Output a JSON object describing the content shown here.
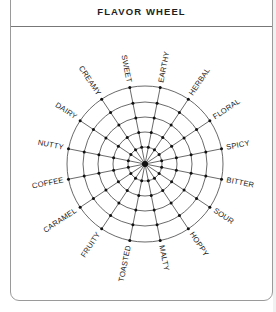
{
  "card": {
    "title": "FLAVOR WHEEL"
  },
  "wheel": {
    "center": [
      145,
      164
    ],
    "ring_radii": [
      17,
      32,
      47,
      62,
      78
    ],
    "label_offset": 5,
    "start_angle_deg": -11.25,
    "stroke_color": "#444444",
    "dot_color": "#111111",
    "flavors": [
      "SWEET",
      "EARTHY",
      "HERBAL",
      "FLORAL",
      "SPICY",
      "BITTER",
      "SOUR",
      "HOPPY",
      "MALTY",
      "TOASTED",
      "FRUITY",
      "CARAMEL",
      "COFFEE",
      "NUTTY",
      "DAIRY",
      "CREAMY"
    ]
  }
}
